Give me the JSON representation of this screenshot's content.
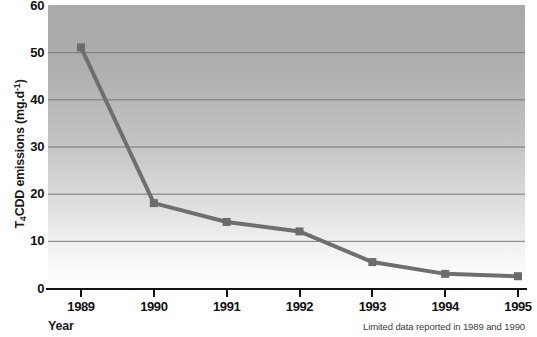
{
  "chart_data": {
    "type": "line",
    "title": "",
    "xlabel": "Year",
    "ylabel": "T4CDD emissions (mg.d-1)",
    "ylabel_parts": {
      "pre": "T",
      "sub": "4",
      "mid": "CDD emissions (mg.d",
      "sup": "-1",
      "post": ")"
    },
    "categories": [
      "1989",
      "1990",
      "1991",
      "1992",
      "1993",
      "1994",
      "1995"
    ],
    "x": [
      1989,
      1990,
      1991,
      1992,
      1993,
      1994,
      1995
    ],
    "values": [
      51,
      18,
      14,
      12,
      5.5,
      3,
      2.5
    ],
    "series": [
      {
        "name": "T4CDD emissions",
        "values": [
          51,
          18,
          14,
          12,
          5.5,
          3,
          2.5
        ]
      }
    ],
    "ylim": [
      0,
      60
    ],
    "yticks": [
      0,
      10,
      20,
      30,
      40,
      50,
      60
    ],
    "ytick_labels": [
      "0",
      "10",
      "20",
      "30",
      "40",
      "50",
      "60"
    ],
    "xlim": [
      1989,
      1995
    ],
    "grid": true,
    "grid_axis": "y",
    "legend": false,
    "legend_position": "none",
    "marker": "square",
    "annotation": "Limited data reported in 1989 and 1990",
    "colors": {
      "line": "#6f6f6f",
      "marker": "#6b6b6b",
      "gridline": "#777777",
      "axis": "#121212",
      "text": "#111111",
      "plot_bg_top": "#a9a9a9",
      "plot_bg_bottom": "#ffffff"
    }
  }
}
